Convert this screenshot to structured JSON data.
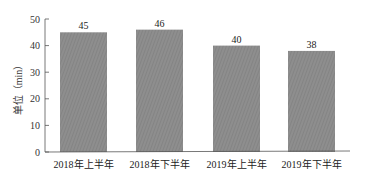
{
  "chart_data": {
    "type": "bar",
    "title": "",
    "xlabel": "",
    "ylabel": "单位（min）",
    "categories": [
      "2018年上半年",
      "2018年下半年",
      "2019年上半年",
      "2019年下半年"
    ],
    "values": [
      45,
      46,
      40,
      38
    ],
    "data_labels": [
      "45",
      "46",
      "40",
      "38"
    ],
    "ylim": [
      0,
      50
    ],
    "yticks": [
      0,
      10,
      20,
      30,
      40,
      50
    ],
    "grid": false,
    "legend": null,
    "bar_color": "#8c8c8c"
  }
}
